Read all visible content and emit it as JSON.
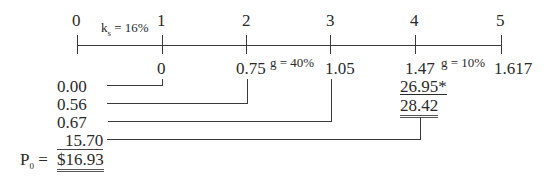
{
  "timeline": {
    "periods": [
      "0",
      "1",
      "2",
      "3",
      "4",
      "5"
    ],
    "ks_label": "k",
    "ks_sub": "s",
    "ks_value": " = 16%",
    "growth_high_label": "g = 40%",
    "growth_low_label": "g = 10%"
  },
  "dividends": [
    "0",
    "0.75",
    "1.05",
    "1.47",
    "1.617"
  ],
  "horizon_value": "26.95*",
  "terminal_total": "28.42",
  "present_values": [
    "0.00",
    "0.56",
    "0.67",
    "15.70"
  ],
  "price": {
    "label": "P",
    "sub": "0",
    "eq": " =",
    "value": "$16.93"
  }
}
